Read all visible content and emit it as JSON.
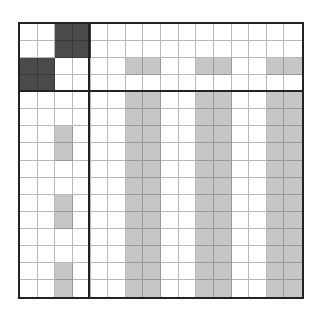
{
  "puzzle": {
    "type": "nonogram-grid",
    "rows": 16,
    "cols": 16,
    "header_rows": 4,
    "header_cols": 4,
    "colors": {
      "empty": "#ffffff",
      "dark": "#4a4a4a",
      "shaded": "#c6c6c6",
      "grid_line": "#b8b8b8",
      "border": "#222222"
    },
    "cells": [
      "..DD............",
      "..DD............",
      "DD....GG..GG..GG",
      "DD..............",
      "......GG..GG..GG",
      "......GG..GG..GG",
      "..G...GG..GG..GG",
      "..G...GG..GG..GG",
      "......GG..GG..GG",
      "......GG..GG..GG",
      "..G...GG..GG..GG",
      "..G...GG..GG..GG",
      "......GG..GG..GG",
      "......GG..GG..GG",
      "..G...GG..GG..GG",
      "..G...GG..GG..GG"
    ]
  }
}
